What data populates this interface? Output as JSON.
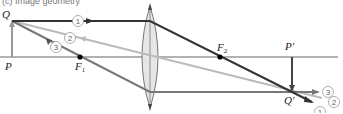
{
  "figure": {
    "caption_partial": "(c) Image geometry",
    "colors": {
      "axis": "#666666",
      "ray1": "#333333",
      "ray2": "#bbbbbb",
      "ray3": "#777777",
      "object": "#999999",
      "image": "#444444",
      "lens_fill": "#e6e6e6",
      "lens_stroke": "#555555"
    },
    "labels": {
      "Q": "Q",
      "P": "P",
      "F1": "F",
      "F1_sub": "1",
      "F2": "F",
      "F2_sub": "2",
      "P_prime": "P′",
      "Q_prime": "Q′"
    },
    "rays": [
      {
        "id": "1",
        "label": "1"
      },
      {
        "id": "2",
        "label": "2"
      },
      {
        "id": "3",
        "label": "3"
      }
    ]
  }
}
